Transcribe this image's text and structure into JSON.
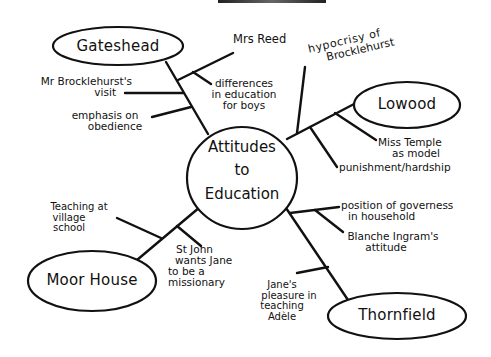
{
  "diagram": {
    "type": "mind-map",
    "center": {
      "label_lines": [
        "Attitudes",
        "to",
        "Education"
      ]
    },
    "nodes": [
      {
        "id": "gateshead",
        "label": "Gateshead",
        "branches": [
          {
            "lines": [
              "Mrs Reed"
            ]
          },
          {
            "lines": [
              "differences",
              "in education",
              "for boys"
            ]
          },
          {
            "lines": [
              "Mr Brocklehurst's",
              "visit"
            ]
          },
          {
            "lines": [
              "emphasis on",
              "obedience"
            ]
          }
        ]
      },
      {
        "id": "lowood",
        "label": "Lowood",
        "branches": [
          {
            "lines": [
              "hypocrisy of",
              "Brocklehurst"
            ]
          },
          {
            "lines": [
              "Miss Temple",
              "as model"
            ]
          },
          {
            "lines": [
              "punishment/hardship"
            ]
          }
        ]
      },
      {
        "id": "moor-house",
        "label": "Moor House",
        "branches": [
          {
            "lines": [
              "Teaching at",
              "village",
              "school"
            ]
          },
          {
            "lines": [
              "St John",
              "wants Jane",
              "to be a",
              "missionary"
            ]
          }
        ]
      },
      {
        "id": "thornfield",
        "label": "Thornfield",
        "branches": [
          {
            "lines": [
              "position of governess",
              "in household"
            ]
          },
          {
            "lines": [
              "Blanche Ingram's",
              "attitude"
            ]
          },
          {
            "lines": [
              "Jane's",
              "pleasure in",
              "teaching",
              "Adèle"
            ]
          }
        ]
      }
    ],
    "colors": {
      "ink": "#111111",
      "background": "#ffffff"
    }
  }
}
